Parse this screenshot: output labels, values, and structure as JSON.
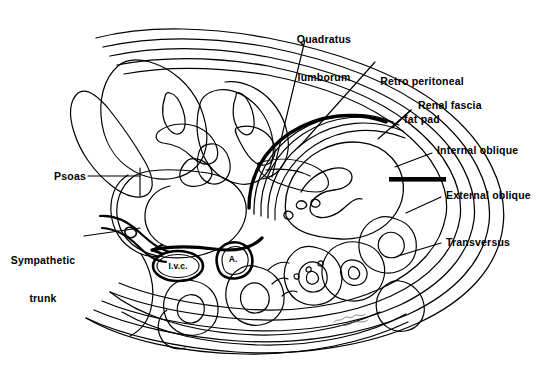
{
  "figure": {
    "background_color": "#ffffff",
    "ink_color": "#000000",
    "signature": "artist-signature"
  },
  "labels": [
    {
      "id": "quadratus-lumborum",
      "text": "Quadratus\nlumborum",
      "line1": "Quadratus",
      "line2": "lumborum"
    },
    {
      "id": "retro-peritoneal-fat-pad",
      "text": "Retro peritoneal\nfat pad",
      "line1": "Retro peritoneal",
      "line2": "fat pad"
    },
    {
      "id": "renal-fascia",
      "text": "Renal fascia",
      "line1": "Renal fascia",
      "line2": ""
    },
    {
      "id": "internal-oblique",
      "text": "Internal oblique",
      "line1": "Internal oblique",
      "line2": ""
    },
    {
      "id": "external-oblique",
      "text": "External oblique",
      "line1": "External oblique",
      "line2": ""
    },
    {
      "id": "transversus",
      "text": "Transversus",
      "line1": "Transversus",
      "line2": ""
    },
    {
      "id": "psoas",
      "text": "Psoas",
      "line1": "Psoas",
      "line2": ""
    },
    {
      "id": "sympathetic-trunk",
      "text": "Sympathetic\ntrunk",
      "line1": "Sympathetic",
      "line2": "trunk"
    }
  ],
  "inner_labels": [
    {
      "id": "ivc",
      "text": "I.v.c.",
      "meaning": "inferior vena cava"
    },
    {
      "id": "aorta",
      "text": "A.",
      "meaning": "aorta"
    }
  ]
}
